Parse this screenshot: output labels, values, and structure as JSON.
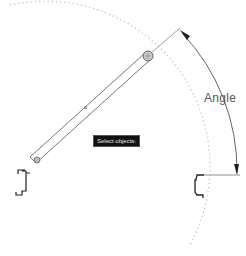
{
  "diagram": {
    "tooltip": "Select objects:",
    "dimension_label": "Angle",
    "colors": {
      "line": "#666666",
      "dotted_arc": "#bbbbbb",
      "profile": "#222222",
      "tooltip_bg": "#111111",
      "tooltip_text": "#e8e8e8"
    },
    "icons": [
      "pivot-grip-icon",
      "end-grip-icon",
      "midpoint-marker-icon"
    ]
  }
}
